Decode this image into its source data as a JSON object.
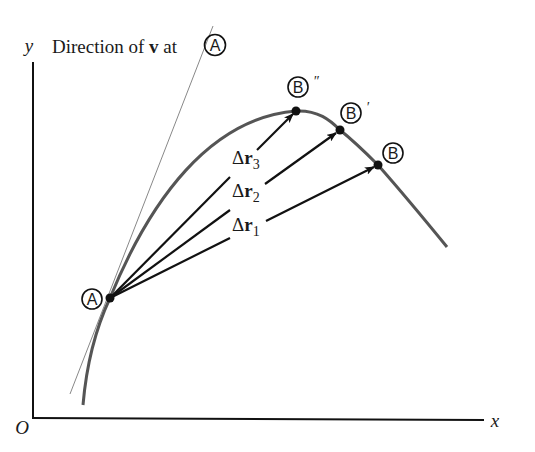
{
  "title_label": {
    "prefix": "Direction of ",
    "vector": "v",
    "suffix": " at"
  },
  "axes": {
    "x_label": "x",
    "y_label": "y",
    "origin_label": "O"
  },
  "points": {
    "A": {
      "label": "A",
      "prime": ""
    },
    "B": {
      "label": "B",
      "prime": ""
    },
    "B_prime": {
      "label": "B",
      "prime": "′"
    },
    "B_double_prime": {
      "label": "B",
      "prime": "″"
    }
  },
  "vectors": [
    {
      "delta": "Δ",
      "symbol": "r",
      "subscript": "1"
    },
    {
      "delta": "Δ",
      "symbol": "r",
      "subscript": "2"
    },
    {
      "delta": "Δ",
      "symbol": "r",
      "subscript": "3"
    }
  ],
  "colors": {
    "curve": "#555555",
    "tangent": "#888888",
    "arrows": "#111111",
    "axes": "#111111"
  }
}
